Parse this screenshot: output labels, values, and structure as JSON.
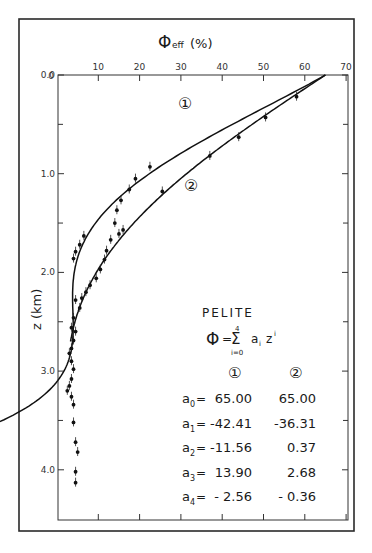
{
  "chart_data": {
    "type": "scatter",
    "title": "PELITE",
    "xlabel": "Φeff (%)",
    "ylabel": "z (km)",
    "xlim": [
      0,
      70
    ],
    "ylim": [
      0.0,
      4.5
    ],
    "y_inverted": true,
    "x_axis_position": "top",
    "x_ticks": [
      10,
      20,
      30,
      40,
      50,
      60,
      70
    ],
    "x_tick_labels": [
      "10",
      "20",
      "30",
      "40",
      "50",
      "60",
      "70"
    ],
    "y_ticks": [
      0.0,
      1.0,
      2.0,
      3.0,
      4.0
    ],
    "y_tick_labels": [
      "0.0",
      "1.0",
      "2.0",
      "3.0",
      "4.0"
    ],
    "y_minor_ticks": [
      0.5,
      1.5,
      2.5,
      3.5
    ],
    "grid": false,
    "legend": "inline curve markers ① and ②",
    "formula": "Φ = Σ(i=0..4) a_i z^i",
    "series": [
      {
        "name": "1",
        "kind": "polynomial_fit",
        "coefficients": {
          "a0": 65.0,
          "a1": -42.41,
          "a2": -11.56,
          "a3": 13.9,
          "a4": -2.56
        },
        "z_range": [
          0.0,
          3.75
        ]
      },
      {
        "name": "2",
        "kind": "polynomial_fit",
        "coefficients": {
          "a0": 65.0,
          "a1": -36.31,
          "a2": 0.37,
          "a3": 2.68,
          "a4": -0.36
        },
        "z_range": [
          0.0,
          2.7
        ]
      },
      {
        "name": "measured",
        "kind": "data_points",
        "points": [
          [
            58.0,
            0.22
          ],
          [
            50.5,
            0.43
          ],
          [
            44.0,
            0.63
          ],
          [
            37.0,
            0.82
          ],
          [
            25.5,
            1.18
          ],
          [
            22.5,
            0.93
          ],
          [
            19.0,
            1.05
          ],
          [
            17.5,
            1.16
          ],
          [
            15.5,
            1.27
          ],
          [
            14.5,
            1.37
          ],
          [
            16.0,
            1.57
          ],
          [
            15.0,
            1.61
          ],
          [
            13.0,
            1.67
          ],
          [
            12.0,
            1.78
          ],
          [
            11.5,
            1.87
          ],
          [
            14.0,
            1.5
          ],
          [
            10.5,
            1.97
          ],
          [
            9.5,
            2.06
          ],
          [
            8.0,
            2.13
          ],
          [
            7.0,
            2.2
          ],
          [
            6.5,
            1.63
          ],
          [
            5.5,
            1.72
          ],
          [
            4.5,
            1.79
          ],
          [
            4.0,
            1.86
          ],
          [
            6.0,
            2.26
          ],
          [
            5.5,
            2.36
          ],
          [
            4.5,
            2.28
          ],
          [
            4.0,
            2.46
          ],
          [
            3.5,
            2.56
          ],
          [
            4.5,
            2.6
          ],
          [
            4.0,
            2.69
          ],
          [
            3.5,
            2.77
          ],
          [
            3.0,
            2.82
          ],
          [
            3.5,
            2.9
          ],
          [
            4.0,
            2.98
          ],
          [
            3.5,
            3.08
          ],
          [
            3.0,
            3.15
          ],
          [
            2.5,
            3.2
          ],
          [
            3.5,
            3.26
          ],
          [
            4.0,
            3.34
          ],
          [
            4.0,
            3.52
          ],
          [
            4.5,
            3.72
          ],
          [
            5.0,
            3.82
          ],
          [
            4.5,
            4.02
          ],
          [
            4.5,
            4.13
          ]
        ]
      }
    ],
    "annotations": [
      {
        "text": "①",
        "x": 31,
        "z": 0.72
      },
      {
        "text": "②",
        "x": 33,
        "z": 1.05
      }
    ]
  },
  "figure": {
    "x_axis_title_main": "Φ",
    "x_axis_title_sub": "eff",
    "x_axis_title_unit": "(%)",
    "y_axis_title": "z (km)",
    "corner_label": "0",
    "curve1_label": "①",
    "curve2_label": "②"
  },
  "inset": {
    "title": "PELITE",
    "formula_lhs": "Φ",
    "formula_eq": "=",
    "sum_symbol": "Σ",
    "sum_upper": "4",
    "sum_lower": "i=0",
    "formula_term_a": "a",
    "formula_term_i": "i",
    "formula_term_z": "z",
    "formula_term_exp": "i",
    "col1_header": "①",
    "col2_header": "②",
    "rows": [
      {
        "name": "a",
        "sub": "0",
        "eq": "=",
        "v1": "65.00",
        "v2": "65.00"
      },
      {
        "name": "a",
        "sub": "1",
        "eq": "=",
        "v1": "-42.41",
        "v2": "-36.31"
      },
      {
        "name": "a",
        "sub": "2",
        "eq": "=",
        "v1": "-11.56",
        "v2": "0.37"
      },
      {
        "name": "a",
        "sub": "3",
        "eq": "=",
        "v1": "13.90",
        "v2": "2.68"
      },
      {
        "name": "a",
        "sub": "4",
        "eq": "=",
        "v1": "- 2.56",
        "v2": "- 0.36"
      }
    ]
  },
  "colors": {
    "ink": "#1a1a1a",
    "background": "#ffffff",
    "frame": "#2a2a2a"
  }
}
